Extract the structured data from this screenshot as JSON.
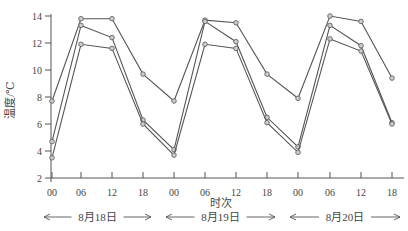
{
  "chart_data": {
    "type": "line",
    "title": "",
    "xlabel": "时次",
    "ylabel": "温度/℃",
    "ylim": [
      2,
      14
    ],
    "yticks": [
      2,
      4,
      6,
      8,
      10,
      12,
      14
    ],
    "x": [
      "00",
      "06",
      "12",
      "18",
      "00",
      "06",
      "12",
      "18",
      "00",
      "06",
      "12",
      "18"
    ],
    "day_groups": [
      {
        "label": "8月18日",
        "start": 0,
        "end": 3
      },
      {
        "label": "8月19日",
        "start": 4,
        "end": 7
      },
      {
        "label": "8月20日",
        "start": 8,
        "end": 11
      }
    ],
    "grid": false,
    "legend": null,
    "series": [
      {
        "name": "series-1",
        "values": [
          7.7,
          13.8,
          13.8,
          9.7,
          7.7,
          13.7,
          13.5,
          9.7,
          7.9,
          14.0,
          13.6,
          9.4
        ]
      },
      {
        "name": "series-2",
        "values": [
          4.7,
          13.3,
          12.4,
          6.3,
          4.1,
          13.6,
          12.1,
          6.5,
          4.3,
          13.3,
          11.8,
          6.1
        ]
      },
      {
        "name": "series-3",
        "values": [
          3.5,
          11.9,
          11.6,
          6.0,
          3.7,
          11.9,
          11.6,
          6.1,
          3.9,
          12.3,
          11.4,
          6.0
        ]
      }
    ]
  },
  "colors": {
    "axis": "#555555",
    "line": "#555555",
    "marker_fill": "#cccccc"
  }
}
